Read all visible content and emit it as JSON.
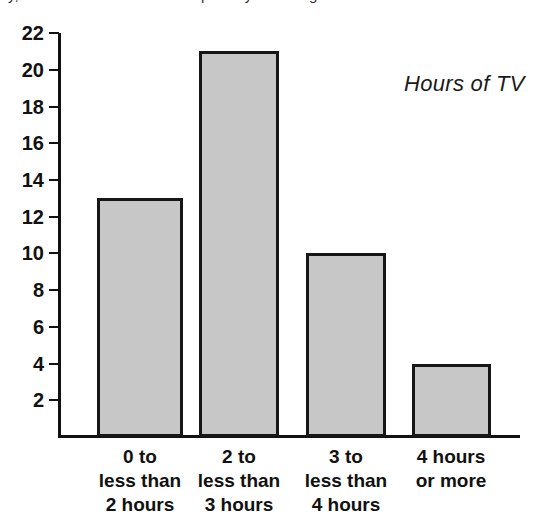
{
  "page": {
    "top_cropped_text": "y, and more than four hours per day watching"
  },
  "annotation": {
    "text": "Hours of TV",
    "x": 404,
    "y": 71
  },
  "chart_data": {
    "type": "bar",
    "title": "Hours of TV",
    "xlabel": "",
    "ylabel": "",
    "categories": [
      "0 to\nless than\n2 hours",
      "2 to\nless than\n3 hours",
      "3 to\nless than\n4 hours",
      "4 hours\nor more"
    ],
    "values": [
      13,
      21,
      10,
      4
    ],
    "ylim": [
      0,
      22
    ],
    "yticks": [
      2,
      4,
      6,
      8,
      10,
      12,
      14,
      16,
      18,
      20,
      22
    ],
    "ytick_labels": [
      "2",
      "4",
      "6",
      "8",
      "10",
      "12",
      "14",
      "16",
      "18",
      "20",
      "22"
    ],
    "grid": false,
    "legend": null,
    "bar_fill_color": "#c7c7c7",
    "bar_edge_color": "#161616",
    "axis_color": "#111111",
    "background_color": "#ffffff"
  },
  "geometry": {
    "axis_x_px": 58,
    "baseline_y_px": 437,
    "top_y_px": 33,
    "px_per_unit": 18.36,
    "plot_right_px": 520,
    "bars": [
      {
        "left": 97,
        "width": 86
      },
      {
        "left": 199,
        "width": 80
      },
      {
        "left": 306,
        "width": 80
      },
      {
        "left": 412,
        "width": 79
      }
    ],
    "cat_label_centers": [
      140,
      239,
      346,
      451
    ]
  }
}
